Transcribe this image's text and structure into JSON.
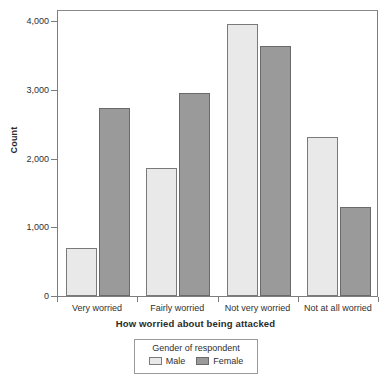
{
  "chart_data": {
    "type": "bar",
    "title": "",
    "xlabel": "How worried about being attacked",
    "ylabel": "Count",
    "categories": [
      "Very worried",
      "Fairly worried",
      "Not very worried",
      "Not at all worried"
    ],
    "series": [
      {
        "name": "Male",
        "values": [
          700,
          1860,
          3960,
          2320
        ],
        "color": "#e9e9e9"
      },
      {
        "name": "Female",
        "values": [
          2730,
          2950,
          3630,
          1290
        ],
        "color": "#9a9a9a"
      }
    ],
    "ylim": [
      0,
      4180
    ],
    "yticks": [
      0,
      1000,
      2000,
      3000,
      4000
    ],
    "ytick_labels": [
      "0",
      "1,000",
      "2,000",
      "3,000",
      "4,000"
    ],
    "grid": false,
    "legend": {
      "title": "Gender of respondent",
      "position": "bottom",
      "entries": [
        "Male",
        "Female"
      ]
    }
  },
  "axis": {
    "y_title": "Count",
    "x_title": "How worried about being attacked"
  }
}
